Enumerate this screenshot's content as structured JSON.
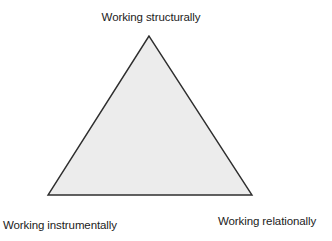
{
  "diagram": {
    "type": "triangle",
    "colors": {
      "fill": "#ececec",
      "stroke": "#2e2e2e",
      "background": "#ffffff",
      "text": "#222222"
    },
    "vertices": {
      "top": {
        "label": "Working structurally"
      },
      "bottom_left": {
        "label": "Working instrumentally"
      },
      "bottom_right": {
        "label": "Working relationally"
      }
    }
  }
}
